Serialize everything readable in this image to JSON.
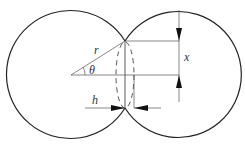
{
  "diagram": {
    "title": "",
    "colors": {
      "stroke": "#222222",
      "thin": "#555555",
      "label": "#333333"
    },
    "labels": {
      "radius": "r",
      "angle": "θ",
      "half_height": "x",
      "width": "h"
    },
    "shapes": {
      "left_circle": {
        "cx": 70,
        "cy": 75,
        "r": 64
      },
      "right_circle": {
        "cx": 180,
        "cy": 75,
        "r": 63
      },
      "neck_ellipse": {
        "cx": 125,
        "cy": 75,
        "rx": 9,
        "ry": 33,
        "style": "dashed"
      }
    }
  }
}
